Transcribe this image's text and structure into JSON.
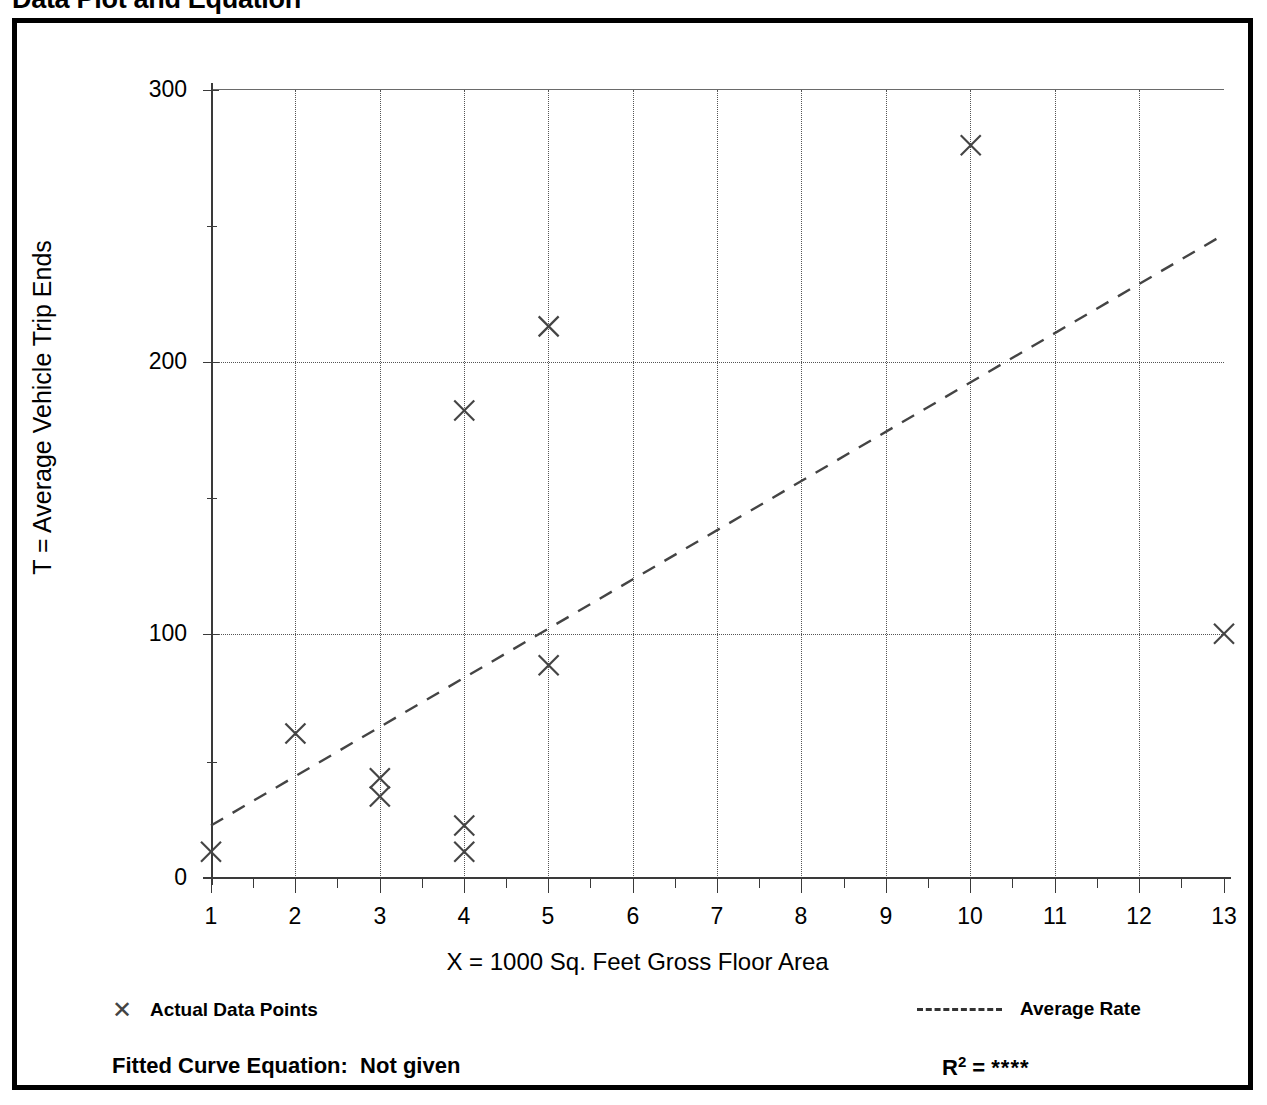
{
  "page_title": "Data Plot and Equation",
  "chart_data": {
    "type": "scatter",
    "title": "Data Plot and Equation",
    "xlabel": "X = 1000 Sq. Feet Gross Floor Area",
    "ylabel": "T = Average Vehicle Trip Ends",
    "xlim": [
      1,
      13
    ],
    "ylim": [
      0,
      300
    ],
    "x_ticks": [
      1,
      2,
      3,
      4,
      5,
      6,
      7,
      8,
      9,
      10,
      11,
      12,
      13
    ],
    "y_ticks": [
      0,
      100,
      200,
      300
    ],
    "grid": true,
    "grid_style": "dotted",
    "legend_position": "below-plot",
    "series": [
      {
        "name": "Actual Data Points",
        "type": "scatter",
        "marker": "x",
        "points": [
          {
            "x": 1,
            "y": 10
          },
          {
            "x": 2,
            "y": 55
          },
          {
            "x": 3,
            "y": 38
          },
          {
            "x": 3,
            "y": 31
          },
          {
            "x": 4,
            "y": 178
          },
          {
            "x": 4,
            "y": 20
          },
          {
            "x": 4,
            "y": 10
          },
          {
            "x": 5,
            "y": 210
          },
          {
            "x": 5,
            "y": 81
          },
          {
            "x": 10,
            "y": 279
          },
          {
            "x": 13,
            "y": 93
          }
        ]
      },
      {
        "name": "Average Rate",
        "type": "line",
        "style": "dashed",
        "points": [
          {
            "x": 1,
            "y": 20
          },
          {
            "x": 13,
            "y": 245
          }
        ]
      }
    ]
  },
  "axis": {
    "y_tick_labels": [
      "300",
      "200",
      "100",
      "0"
    ],
    "x_tick_labels": [
      "1",
      "2",
      "3",
      "4",
      "5",
      "6",
      "7",
      "8",
      "9",
      "10",
      "11",
      "12",
      "13"
    ],
    "y_title": "T = Average Vehicle Trip Ends",
    "x_title": "X = 1000 Sq. Feet Gross Floor Area"
  },
  "legend": {
    "points_label": "Actual Data Points",
    "line_label": "Average Rate"
  },
  "footer": {
    "fitted_label": "Fitted Curve Equation:  Not given",
    "r2_prefix": "R",
    "r2_exponent": "2",
    "r2_equals": " = ",
    "r2_value": "****"
  },
  "colors": {
    "axis": "#3a3a3a",
    "marker": "#444444",
    "grid": "#555555",
    "frame": "#000000"
  }
}
